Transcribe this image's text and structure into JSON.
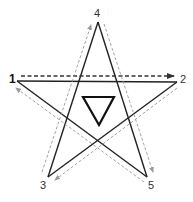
{
  "diagram": {
    "type": "pentagram-stroke-order",
    "vertices": [
      {
        "id": "1",
        "label": "1",
        "x": 17,
        "y": 81,
        "bold": true
      },
      {
        "id": "2",
        "label": "2",
        "x": 177,
        "y": 82,
        "bold": false
      },
      {
        "id": "3",
        "label": "3",
        "x": 48,
        "y": 177,
        "bold": false
      },
      {
        "id": "4",
        "label": "4",
        "x": 98,
        "y": 22,
        "bold": false
      },
      {
        "id": "5",
        "label": "5",
        "x": 147,
        "y": 177,
        "bold": false
      }
    ],
    "stroke_order": [
      "1",
      "2",
      "3",
      "4",
      "5",
      "1"
    ],
    "start_arrow": {
      "from": "1",
      "to": "2",
      "style": "dashed-dark"
    },
    "guide_arrows": [
      {
        "from": "2",
        "to": "3",
        "style": "dashed-gray"
      },
      {
        "from": "3",
        "to": "4",
        "style": "dashed-gray"
      },
      {
        "from": "4",
        "to": "5",
        "style": "dashed-gray"
      },
      {
        "from": "5",
        "to": "1",
        "style": "dashed-gray"
      }
    ],
    "center_symbol": {
      "shape": "inverted-triangle",
      "points": [
        [
          83,
          97
        ],
        [
          114,
          97
        ],
        [
          99,
          125
        ]
      ]
    },
    "colors": {
      "star_line": "#222222",
      "start_arrow": "#333333",
      "guide_arrow": "#9a9a9a",
      "label": "#333333",
      "background": "#ffffff"
    }
  }
}
